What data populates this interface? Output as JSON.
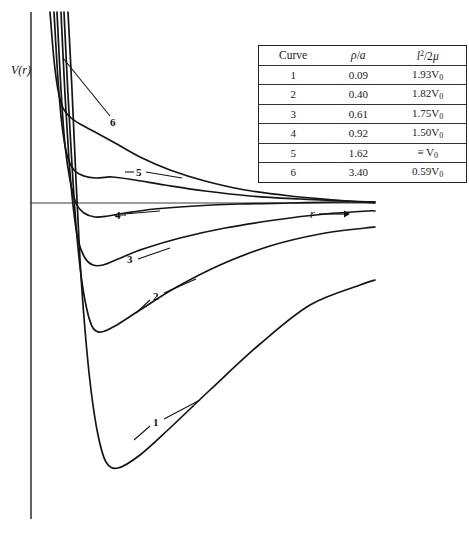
{
  "figure": {
    "y_axis_label": "V(r)",
    "x_axis_label": "r",
    "x_axis_arrow": "→"
  },
  "table": {
    "headers": {
      "curve": "Curve",
      "rho_over_a": "ρ/a",
      "l_squared_over_2mu": "l²/2μ"
    },
    "rows": [
      {
        "curve": "1",
        "rho_a": "0.09",
        "l2_2mu": "1.93V₀"
      },
      {
        "curve": "2",
        "rho_a": "0.40",
        "l2_2mu": "1.82V₀"
      },
      {
        "curve": "3",
        "rho_a": "0.61",
        "l2_2mu": "1.75V₀"
      },
      {
        "curve": "4",
        "rho_a": "0.92",
        "l2_2mu": "1.50V₀"
      },
      {
        "curve": "5",
        "rho_a": "1.62",
        "l2_2mu": "≡ V₀"
      },
      {
        "curve": "6",
        "rho_a": "3.40",
        "l2_2mu": "0.59V₀"
      }
    ]
  },
  "curve_labels": {
    "c1": "1",
    "c2": "2",
    "c3": "3",
    "c4": "4",
    "c5": "5",
    "c6": "6"
  },
  "chart_data": {
    "type": "line",
    "title": "",
    "xlabel": "r",
    "ylabel": "V(r)",
    "grid": false,
    "legend": "table",
    "xlim": [
      0,
      1
    ],
    "ylim": [
      -1,
      1
    ],
    "axis_origin_px": {
      "x": 31,
      "y": 203
    },
    "series": [
      {
        "name": "1",
        "rho_over_a": 0.09,
        "l2_over_2mu": "1.93V0",
        "minimum_px": [
          105,
          463
        ],
        "label_px": [
          157,
          422
        ],
        "points_px": [
          [
            68,
            12
          ],
          [
            72,
            90
          ],
          [
            76,
            180
          ],
          [
            80,
            260
          ],
          [
            85,
            330
          ],
          [
            91,
            390
          ],
          [
            98,
            435
          ],
          [
            106,
            462
          ],
          [
            118,
            468
          ],
          [
            140,
            455
          ],
          [
            170,
            428
          ],
          [
            210,
            390
          ],
          [
            260,
            344
          ],
          [
            310,
            305
          ],
          [
            360,
            285
          ],
          [
            375,
            280
          ]
        ]
      },
      {
        "name": "2",
        "rho_over_a": 0.4,
        "l2_over_2mu": "1.82V0",
        "minimum_px": [
          96,
          330
        ],
        "label_px": [
          157,
          296
        ],
        "points_px": [
          [
            64,
            12
          ],
          [
            68,
            95
          ],
          [
            72,
            165
          ],
          [
            76,
            225
          ],
          [
            81,
            275
          ],
          [
            87,
            310
          ],
          [
            93,
            328
          ],
          [
            101,
            332
          ],
          [
            115,
            326
          ],
          [
            140,
            310
          ],
          [
            175,
            288
          ],
          [
            220,
            265
          ],
          [
            270,
            246
          ],
          [
            320,
            234
          ],
          [
            365,
            228
          ],
          [
            375,
            227
          ]
        ]
      },
      {
        "name": "3",
        "rho_over_a": 0.61,
        "l2_over_2mu": "1.75V0",
        "minimum_px": [
          100,
          265
        ],
        "label_px": [
          131,
          258
        ],
        "points_px": [
          [
            61,
            12
          ],
          [
            65,
            95
          ],
          [
            69,
            160
          ],
          [
            73,
            205
          ],
          [
            78,
            240
          ],
          [
            85,
            258
          ],
          [
            93,
            265
          ],
          [
            103,
            265
          ],
          [
            118,
            259
          ],
          [
            143,
            249
          ],
          [
            180,
            238
          ],
          [
            225,
            228
          ],
          [
            275,
            220
          ],
          [
            325,
            214
          ],
          [
            368,
            211
          ],
          [
            375,
            211
          ]
        ]
      },
      {
        "name": "4",
        "rho_over_a": 0.92,
        "l2_over_2mu": "1.50V0",
        "minimum_px": [
          104,
          216
        ],
        "label_px": [
          119,
          215
        ],
        "points_px": [
          [
            57,
            12
          ],
          [
            61,
            90
          ],
          [
            65,
            145
          ],
          [
            70,
            180
          ],
          [
            76,
            203
          ],
          [
            84,
            213
          ],
          [
            95,
            217
          ],
          [
            108,
            216
          ],
          [
            125,
            213
          ],
          [
            155,
            209
          ],
          [
            195,
            206
          ],
          [
            240,
            204
          ],
          [
            290,
            203
          ],
          [
            340,
            202
          ],
          [
            375,
            202
          ]
        ]
      },
      {
        "name": "5",
        "rho_over_a": 1.62,
        "l2_over_2mu": "= V0",
        "minimum_px": [
          103,
          177
        ],
        "label_px": [
          139,
          172
        ],
        "points_px": [
          [
            54,
            12
          ],
          [
            58,
            80
          ],
          [
            62,
            125
          ],
          [
            67,
            155
          ],
          [
            74,
            170
          ],
          [
            84,
            176
          ],
          [
            96,
            178
          ],
          [
            112,
            177
          ],
          [
            135,
            180
          ],
          [
            165,
            185
          ],
          [
            205,
            191
          ],
          [
            250,
            196
          ],
          [
            300,
            199
          ],
          [
            345,
            201
          ],
          [
            375,
            202
          ]
        ]
      },
      {
        "name": "6",
        "rho_over_a": 3.4,
        "l2_over_2mu": "0.59V0",
        "minimum_px": null,
        "label_px": [
          115,
          122
        ],
        "points_px": [
          [
            50,
            12
          ],
          [
            54,
            60
          ],
          [
            58,
            90
          ],
          [
            63,
            108
          ],
          [
            70,
            117
          ],
          [
            80,
            124
          ],
          [
            95,
            132
          ],
          [
            115,
            143
          ],
          [
            140,
            157
          ],
          [
            170,
            170
          ],
          [
            205,
            181
          ],
          [
            245,
            190
          ],
          [
            290,
            196
          ],
          [
            335,
            200
          ],
          [
            375,
            203
          ]
        ]
      }
    ]
  }
}
